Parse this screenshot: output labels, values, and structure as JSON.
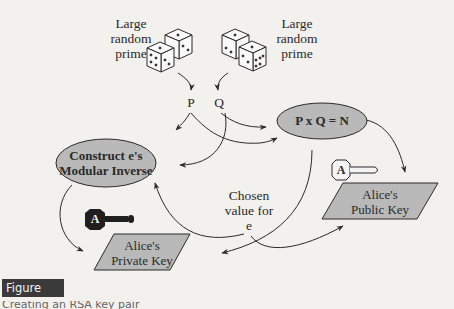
{
  "diagram": {
    "sources": [
      {
        "label_lines": [
          "Large",
          "random",
          "prime"
        ],
        "output": "P"
      },
      {
        "label_lines": [
          "Large",
          "random",
          "prime"
        ],
        "output": "Q"
      }
    ],
    "variables": {
      "p": "P",
      "q": "Q"
    },
    "nodes": {
      "modular_inverse": {
        "lines": [
          "Construct e's",
          "Modular Inverse"
        ]
      },
      "product": {
        "text": "P x Q = N"
      },
      "private_key": {
        "lines": [
          "Alice's",
          "Private Key"
        ],
        "key_letter": "A"
      },
      "public_key": {
        "lines": [
          "Alice's",
          "Public Key"
        ],
        "key_letter": "A"
      }
    },
    "chosen_e": {
      "lines": [
        "Chosen",
        "value for",
        "e"
      ]
    },
    "colors": {
      "node_fill": "#b9b9b9",
      "stroke": "#2a2a2a",
      "background": "#f2f1ee",
      "private_key_fill": "#1f1f1f",
      "public_key_fill": "#f4f4f4"
    }
  },
  "figure": {
    "label": "Figure 8.17",
    "caption": "Creating an RSA key pair"
  }
}
